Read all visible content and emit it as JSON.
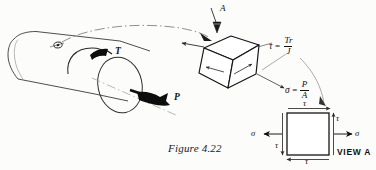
{
  "figure": {
    "caption": "Figure 4.22",
    "view_label": "VIEW A",
    "view_direction_marker": "A"
  },
  "shaft": {
    "torque_label": "T",
    "axial_force_label": "P",
    "element_marker": "stress-element-location"
  },
  "cube": {
    "shear_formula": {
      "symbol": "τ",
      "equals": "=",
      "numerator": "Tr",
      "denominator": "J",
      "full": "τ = Tr/J"
    },
    "normal_formula": {
      "symbol": "σ",
      "equals": "=",
      "numerator": "P",
      "denominator": "A",
      "full": "σ = P/A"
    }
  },
  "stress_element": {
    "tau_top": "τ",
    "tau_right": "τ",
    "tau_bottom": "τ",
    "tau_left": "τ",
    "sigma_left": "σ",
    "sigma_right": "σ"
  },
  "colors": {
    "ink": "#111111",
    "line": "#2a2a2a",
    "fill_solid": "#0d0d0d",
    "background": "#fcfcfb",
    "leader": "#555555"
  }
}
